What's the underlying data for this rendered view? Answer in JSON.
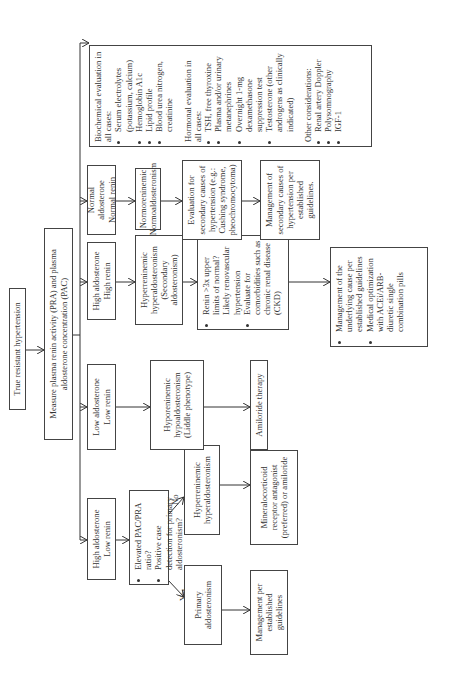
{
  "title": "True resistant hypertension",
  "measure": "Measure plasma renin activity (PRA) and plasma aldosterone concentration (PAC)",
  "categories": [
    {
      "line1": "High aldosterone",
      "line2": "Low renin"
    },
    {
      "line1": "Low aldosterone",
      "line2": "Low renin"
    },
    {
      "line1": "High aldosterone",
      "line2": "High renin"
    },
    {
      "line1": "Normal aldosterone",
      "line2": "Normal renin"
    }
  ],
  "pac_question": [
    "Elevated PAC/PRA ratio?",
    "Positive case detection for primary aldosteronism?"
  ],
  "yes_label": "Yes",
  "no_label": "No",
  "primary": "Primary aldosteronism",
  "primary_mgmt": "Management per established guidelines",
  "hyperreninemic_hyperaldo_1": "Hyperreninemic hyperaldosteronism",
  "mr_antagonist": "Mineralocorticoid receptor antagonist (preferred) or amiloride",
  "hyporeninemic": "Hyporeninemic hypoaldosteronism (Liddle phenotype)",
  "amiloride": "Amiloride therapy",
  "secondary": "Hyperreninemic hyperaldosteronism (Secondary aldosteronism)",
  "renin_box": [
    "Renin >3x upper limits of normal? Likely renovascular hypertension",
    "Evaluate for comorbidities such as chronic renal disease (CKD)"
  ],
  "underlying_mgmt": [
    "Management of the underlying cause per established guidelines",
    "Medical optimization with ACEi/ARB-diuretic single combination pills"
  ],
  "normo": "Normoreninemic Normoaldosteronism",
  "eval_secondary": "Evaluation for secondary causes of hypertension (e.g.: Cushing syndrome, pheochromocytoma)",
  "mgmt_secondary": "Management of secondary causes of hypertension per established guidelines.",
  "side_panel": {
    "biochem_title": "Biochemical evaluation in all cases:",
    "biochem_items": [
      "Serum electrolytes (potassium, calcium)",
      "Hemoglobin A1c",
      "Lipid profile",
      "Blood urea nitrogen, creatinine"
    ],
    "hormonal_title": "Hormonal evaluation in all cases:",
    "hormonal_items": [
      "TSH, free thyroxine",
      "Plasma and/or urinary metanephrines",
      "Overnight 1-mg dexamethasone suppression test",
      "Testosterone (other androgens as clinically indicated)"
    ],
    "other_title": "Other considerations:",
    "other_items": [
      "Renal artery Doppler",
      "Polysomnography",
      "IGF-1"
    ]
  }
}
